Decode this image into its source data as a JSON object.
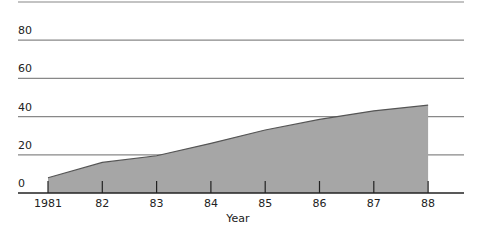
{
  "chart_data": {
    "type": "area",
    "title": "",
    "xlabel": "Year",
    "ylabel": "",
    "categories": [
      "1981",
      "82",
      "83",
      "84",
      "85",
      "86",
      "87",
      "88"
    ],
    "series": [
      {
        "name": "value",
        "values": [
          8,
          16,
          19.5,
          26,
          33,
          38.5,
          43,
          46
        ]
      }
    ],
    "y_ticks": [
      0,
      20,
      40,
      60,
      80
    ],
    "ylim": [
      0,
      100
    ],
    "grid": true,
    "legend": "none",
    "colors": {
      "fill": "#a6a6a6",
      "stroke": "#555555",
      "grid": "#888888",
      "axis": "#222222"
    }
  }
}
